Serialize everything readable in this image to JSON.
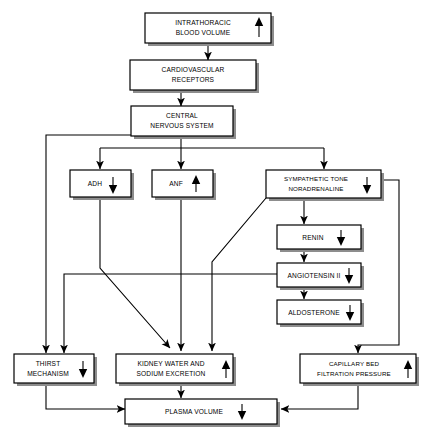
{
  "diagram": {
    "colors": {
      "box_fill": "#ffffff",
      "box_stroke": "#000000",
      "shadow": "#8d8d8d",
      "connector": "#000000"
    },
    "nodes": [
      {
        "id": "intrathoracic-blood-volume",
        "lines": [
          "INTRATHORACIC",
          "BLOOD VOLUME"
        ],
        "trend": "up",
        "trend_glyph": "↑"
      },
      {
        "id": "cardiovascular-receptors",
        "lines": [
          "CARDIOVASCULAR",
          "RECEPTORS"
        ],
        "trend": "none",
        "trend_glyph": ""
      },
      {
        "id": "central-nervous-system",
        "lines": [
          "CENTRAL",
          "NERVOUS SYSTEM"
        ],
        "trend": "none",
        "trend_glyph": ""
      },
      {
        "id": "adh",
        "lines": [
          "ADH"
        ],
        "trend": "down",
        "trend_glyph": "↓"
      },
      {
        "id": "anf",
        "lines": [
          "ANF"
        ],
        "trend": "up",
        "trend_glyph": "↑"
      },
      {
        "id": "sympathetic-tone-noradrenaline",
        "lines": [
          "SYMPATHETIC TONE",
          "NORADRENALINE"
        ],
        "trend": "down",
        "trend_glyph": "↓"
      },
      {
        "id": "renin",
        "lines": [
          "RENIN"
        ],
        "trend": "down",
        "trend_glyph": "↓"
      },
      {
        "id": "angiotensin-ii",
        "lines": [
          "ANGIOTENSIN II"
        ],
        "trend": "down",
        "trend_glyph": "↓"
      },
      {
        "id": "aldosterone",
        "lines": [
          "ALDOSTERONE"
        ],
        "trend": "down",
        "trend_glyph": "↓"
      },
      {
        "id": "thirst-mechanism",
        "lines": [
          "THIRST",
          "MECHANISM"
        ],
        "trend": "down",
        "trend_glyph": "↓"
      },
      {
        "id": "kidney-water-and-sodium-excretion",
        "lines": [
          "KIDNEY WATER AND",
          "SODIUM EXCRETION"
        ],
        "trend": "up",
        "trend_glyph": "↑"
      },
      {
        "id": "capillary-bed-filtration-pressure",
        "lines": [
          "CAPILLARY BED",
          "FILTRATION PRESSURE"
        ],
        "trend": "up",
        "trend_glyph": "↑"
      },
      {
        "id": "plasma-volume",
        "lines": [
          "PLASMA VOLUME"
        ],
        "trend": "down",
        "trend_glyph": "↓"
      }
    ]
  }
}
